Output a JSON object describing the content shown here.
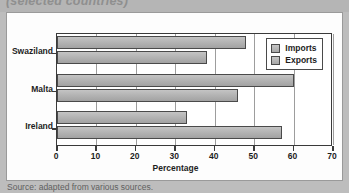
{
  "figure": {
    "title_truncated": "(selected countries)",
    "source_note": "Source: adapted from various sources."
  },
  "legend": {
    "entries": [
      {
        "label": "Imports",
        "swatch": "gray-swatch-icon"
      },
      {
        "label": "Exports",
        "swatch": "gray-swatch-icon"
      }
    ]
  },
  "axes": {
    "x_title": "Percentage",
    "x_ticks": [
      "0",
      "10",
      "20",
      "30",
      "40",
      "50",
      "60",
      "70"
    ],
    "y_ticks": [
      "Swaziland",
      "Malta",
      "Ireland"
    ]
  },
  "chart_data": {
    "type": "bar",
    "orientation": "horizontal",
    "title": "(selected countries)",
    "categories": [
      "Swaziland",
      "Malta",
      "Ireland"
    ],
    "series": [
      {
        "name": "Imports",
        "values": [
          48,
          60,
          33
        ]
      },
      {
        "name": "Exports",
        "values": [
          38,
          46,
          57
        ]
      }
    ],
    "xlabel": "Percentage",
    "ylabel": "",
    "xlim": [
      0,
      70
    ],
    "xticks": [
      0,
      10,
      20,
      30,
      40,
      50,
      60,
      70
    ],
    "grid": "vertical",
    "legend_position": "top-right",
    "source": "Source: adapted from various sources."
  }
}
